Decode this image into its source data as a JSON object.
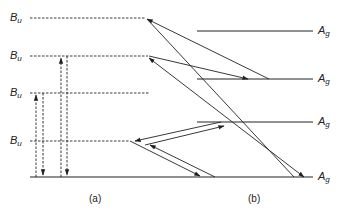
{
  "diagram": {
    "left_levels": [
      {
        "symbol": "B",
        "subscript": "u",
        "y": 18
      },
      {
        "symbol": "B",
        "subscript": "u",
        "y": 56
      },
      {
        "symbol": "B",
        "subscript": "u",
        "y": 93
      },
      {
        "symbol": "B",
        "subscript": "u",
        "y": 141
      }
    ],
    "right_levels": [
      {
        "symbol": "A",
        "subscript": "g",
        "y": 31
      },
      {
        "symbol": "A",
        "subscript": "g",
        "y": 79
      },
      {
        "symbol": "A",
        "subscript": "g",
        "y": 122
      },
      {
        "symbol": "A",
        "subscript": "g",
        "y": 177
      }
    ],
    "captions": {
      "a": "(a)",
      "b": "(b)"
    },
    "colors": {
      "line": "#222222",
      "background": "#ffffff"
    }
  }
}
